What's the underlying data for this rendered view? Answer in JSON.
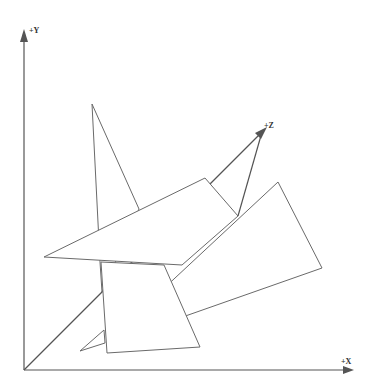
{
  "diagram": {
    "title": "",
    "axes": {
      "x": {
        "label": "+X"
      },
      "y": {
        "label": "+Y"
      },
      "z": {
        "label": "+Z"
      }
    },
    "colors": {
      "background": "#ffffff",
      "axis": "#555555",
      "edge": "#6a6a6a",
      "label": "#333333"
    },
    "shapes": [
      {
        "name": "right-plane",
        "kind": "quadrilateral"
      },
      {
        "name": "tall-triangle",
        "kind": "triangle"
      },
      {
        "name": "wide-triangle",
        "kind": "triangle"
      },
      {
        "name": "front-quad",
        "kind": "quadrilateral"
      },
      {
        "name": "small-wedge",
        "kind": "triangle"
      }
    ]
  }
}
